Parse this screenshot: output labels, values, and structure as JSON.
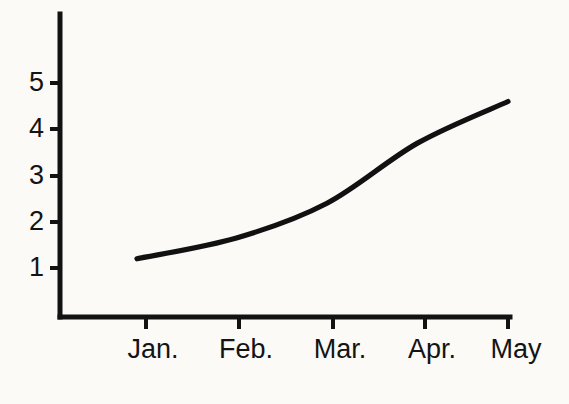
{
  "chart_data": {
    "type": "line",
    "title": "",
    "subtitle": "",
    "xlabel": "",
    "ylabel": "",
    "categories": [
      "Jan.",
      "Feb.",
      "Mar.",
      "Apr.",
      "May"
    ],
    "x": [
      1,
      2,
      3,
      4,
      5
    ],
    "series": [
      {
        "name": "",
        "values": [
          1.2,
          1.65,
          2.4,
          3.7,
          4.6
        ]
      }
    ],
    "points": [
      {
        "x_label": "Jan.",
        "x": 1,
        "y": 1.2
      },
      {
        "x_label": "Feb.",
        "x": 2,
        "y": 1.65
      },
      {
        "x_label": "Mar.",
        "x": 3,
        "y": 2.4
      },
      {
        "x_label": "Apr.",
        "x": 4,
        "y": 3.7
      },
      {
        "x_label": "May",
        "x": 5,
        "y": 4.6
      }
    ],
    "y_ticks": [
      1,
      2,
      3,
      4,
      5
    ],
    "y_tick_labels": [
      "1",
      "2",
      "3",
      "4",
      "5"
    ],
    "x_tick_labels": [
      "Jan.",
      "Feb.",
      "Mar.",
      "Apr.",
      "May"
    ],
    "xlim": [
      0.55,
      5.0
    ],
    "ylim": [
      0,
      6.6
    ],
    "grid": false,
    "legend": null,
    "annotations": [],
    "line_color": "#111111",
    "axis_color": "#121212",
    "background_color": "#fbfaf7"
  },
  "axis": {
    "y_labels": [
      {
        "text": "5",
        "y_px": 83
      },
      {
        "text": "4",
        "y_px": 129
      },
      {
        "text": "3",
        "y_px": 176
      },
      {
        "text": "2",
        "y_px": 222
      },
      {
        "text": "1",
        "y_px": 268
      }
    ],
    "x_labels": [
      {
        "text": "Jan.",
        "x_px": 153
      },
      {
        "text": "Feb.",
        "x_px": 246
      },
      {
        "text": "Mar.",
        "x_px": 340
      },
      {
        "text": "Apr.",
        "x_px": 432
      },
      {
        "text": "May",
        "x_px": 516
      }
    ]
  }
}
